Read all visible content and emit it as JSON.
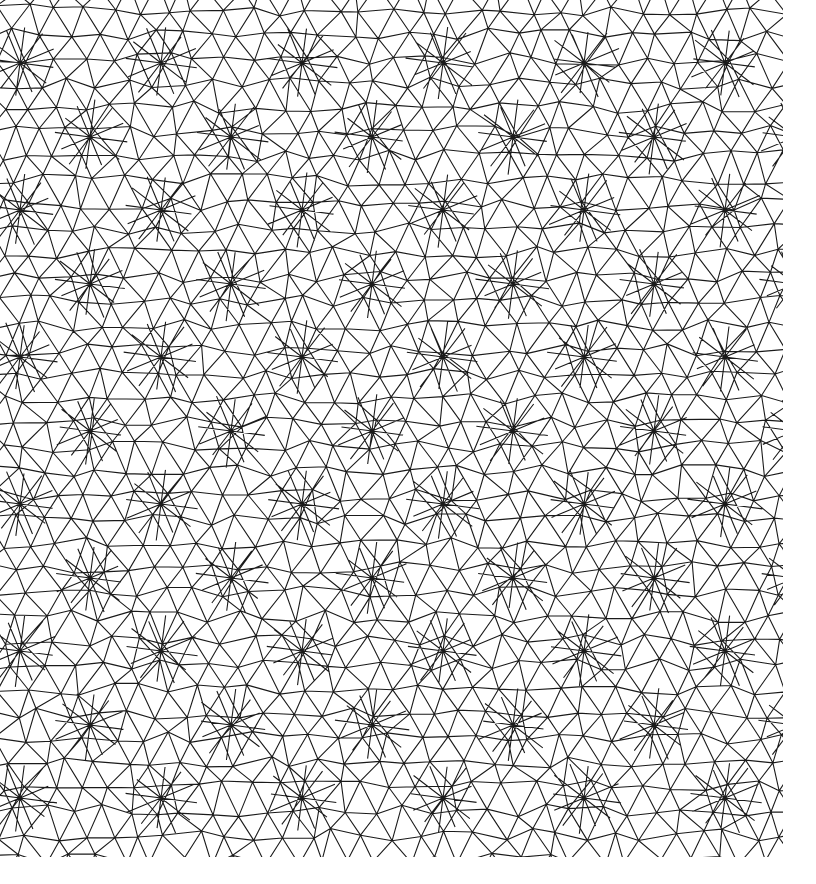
{
  "image": {
    "kind": "geometric triangulated line pattern",
    "width": 816,
    "height": 884,
    "pattern_extent": {
      "x0": 0,
      "y0": 0,
      "x1": 783,
      "y1": 857
    },
    "background_color": "#ffffff",
    "line_color": "#1a1a1a",
    "line_width": 1.1
  }
}
